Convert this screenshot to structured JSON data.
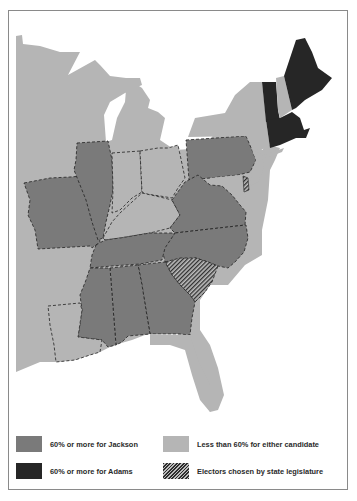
{
  "map": {
    "title": "Election map: share of vote by state",
    "colors": {
      "jackson": "#7a7a7a",
      "adams": "#262626",
      "neither": "#b5b5b5",
      "legislature_stripe_dark": "#2e2e2e",
      "legislature_stripe_light": "#bdbdbd",
      "background": "#ffffff",
      "border": "#8a8a8a"
    },
    "states": [
      {
        "name": "Maine",
        "category": "adams"
      },
      {
        "name": "Vermont",
        "category": "adams"
      },
      {
        "name": "Massachusetts",
        "category": "adams"
      },
      {
        "name": "Rhode Island",
        "category": "adams"
      },
      {
        "name": "Connecticut",
        "category": "adams"
      },
      {
        "name": "New Hampshire",
        "category": "neither"
      },
      {
        "name": "New York",
        "category": "neither"
      },
      {
        "name": "New Jersey",
        "category": "neither"
      },
      {
        "name": "Maryland",
        "category": "neither"
      },
      {
        "name": "Ohio",
        "category": "neither"
      },
      {
        "name": "Indiana",
        "category": "neither"
      },
      {
        "name": "Kentucky",
        "category": "neither"
      },
      {
        "name": "Louisiana",
        "category": "neither"
      },
      {
        "name": "Pennsylvania",
        "category": "jackson"
      },
      {
        "name": "Virginia",
        "category": "jackson"
      },
      {
        "name": "North Carolina",
        "category": "jackson"
      },
      {
        "name": "Tennessee",
        "category": "jackson"
      },
      {
        "name": "Georgia",
        "category": "jackson"
      },
      {
        "name": "Alabama",
        "category": "jackson"
      },
      {
        "name": "Mississippi",
        "category": "jackson"
      },
      {
        "name": "Illinois",
        "category": "jackson"
      },
      {
        "name": "Missouri",
        "category": "jackson"
      },
      {
        "name": "South Carolina",
        "category": "legislature"
      },
      {
        "name": "Delaware",
        "category": "legislature"
      }
    ]
  },
  "legend": {
    "items": [
      {
        "key": "jackson",
        "label": "60% or more for Jackson"
      },
      {
        "key": "neither",
        "label": "Less than 60% for either candidate"
      },
      {
        "key": "adams",
        "label": "60% or more for Adams"
      },
      {
        "key": "legislature",
        "label": "Electors chosen by state legislature"
      }
    ]
  }
}
